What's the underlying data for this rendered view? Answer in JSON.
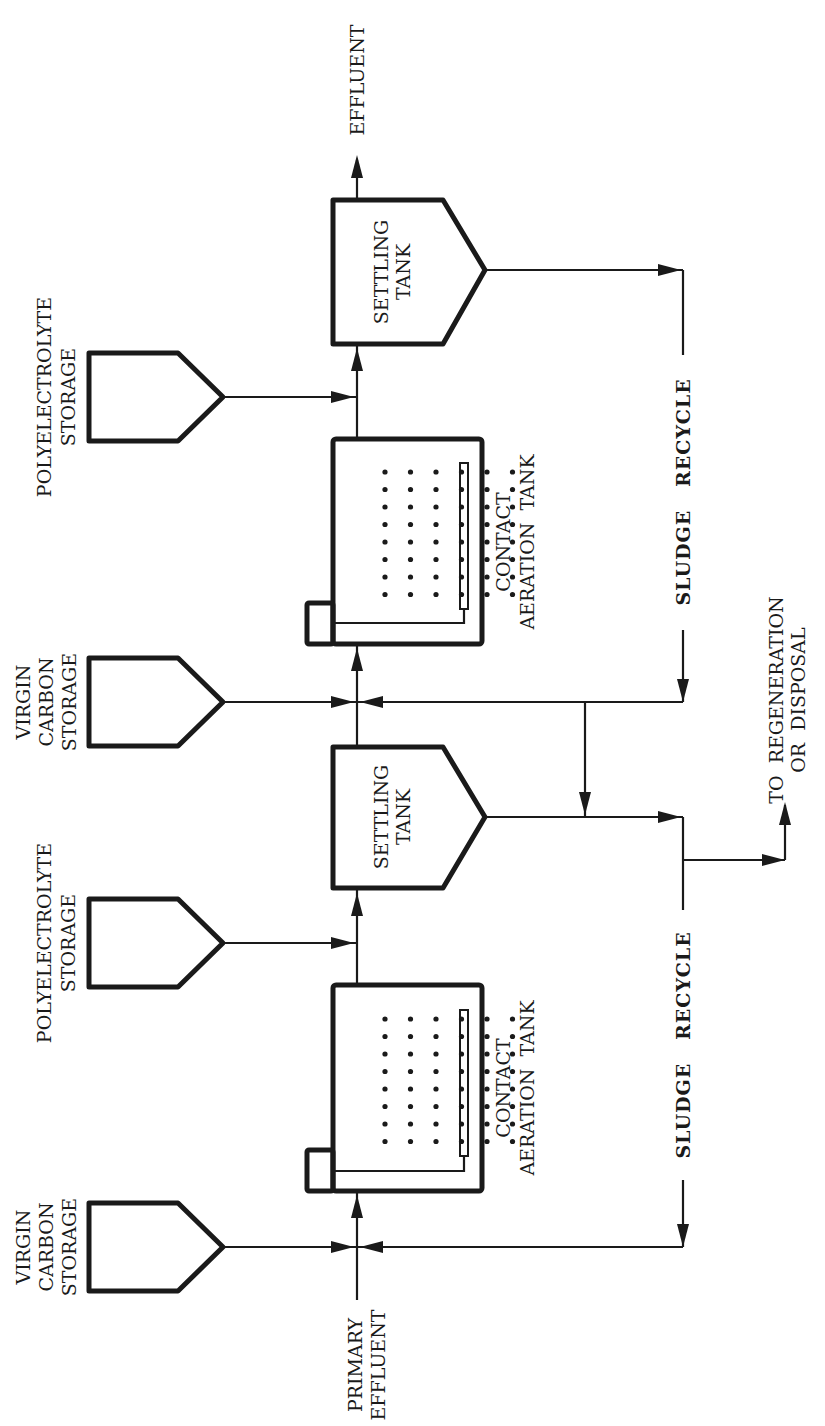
{
  "diagram": {
    "type": "process-flow",
    "orientation": "rotated-90-ccw",
    "stage1": {
      "carbon_storage": {
        "lines": [
          "VIRGIN",
          "CARBON",
          "STORAGE"
        ]
      },
      "polyelectrolyte_storage": {
        "lines": [
          "POLYELECTROLYTE",
          "STORAGE"
        ]
      },
      "aeration_tank": {
        "lines": [
          "CONTACT",
          "AERATION  TANK"
        ]
      },
      "settling_tank": {
        "lines": [
          "SETTLING",
          "TANK"
        ]
      },
      "sludge_recycle": "SLUDGE   RECYCLE"
    },
    "stage2": {
      "carbon_storage": {
        "lines": [
          "VIRGIN",
          "CARBON",
          "STORAGE"
        ]
      },
      "polyelectrolyte_storage": {
        "lines": [
          "POLYELECTROLYTE",
          "STORAGE"
        ]
      },
      "aeration_tank": {
        "lines": [
          "CONTACT",
          "AERATION  TANK"
        ]
      },
      "settling_tank": {
        "lines": [
          "SETTLING",
          "TANK"
        ]
      },
      "sludge_recycle": "SLUDGE   RECYCLE"
    },
    "inlet": {
      "lines": [
        "PRIMARY",
        "EFFLUENT"
      ]
    },
    "outlet": "EFFLUENT",
    "waste": {
      "lines": [
        "TO  REGENERATION",
        "OR  DISPOSAL"
      ]
    },
    "colors": {
      "ink": "#1a1a1a",
      "background": "#ffffff"
    }
  }
}
